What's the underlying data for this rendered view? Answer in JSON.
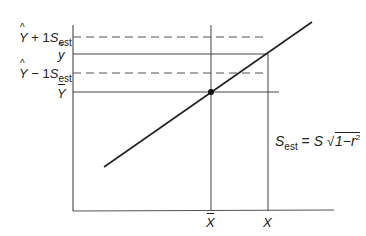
{
  "diagram": {
    "type": "regression-standard-error-of-estimate",
    "colors": {
      "line": "#222222",
      "axis": "#555555",
      "guide": "#444444",
      "dashed": "#555555"
    },
    "y_labels": {
      "upper": {
        "var": "Y",
        "op": "+ 1",
        "s": "S",
        "sub": "est"
      },
      "y_tilde": {
        "var": "y"
      },
      "lower": {
        "var": "Y",
        "op": "− 1",
        "s": "S",
        "sub": "est"
      },
      "y_bar": {
        "var": "Y"
      }
    },
    "x_labels": {
      "x_bar": {
        "var": "X"
      },
      "x": {
        "var": "X"
      }
    },
    "formula": {
      "lhs": "S",
      "lhs_sub": "est",
      "eq": "=",
      "rhs": "S",
      "radicand": "1−r",
      "exp": "2"
    },
    "geometry": {
      "axis_origin": [
        73,
        211
      ],
      "y_axis_top": 25,
      "x_axis_right": 334,
      "regression_start": [
        104,
        167
      ],
      "regression_end": [
        312,
        22
      ],
      "mean_point": [
        211,
        92
      ],
      "x_bar_x": 211,
      "x_x": 268,
      "y_upper": 37,
      "y_tilde": 54,
      "y_lower": 73,
      "y_bar": 92
    }
  }
}
